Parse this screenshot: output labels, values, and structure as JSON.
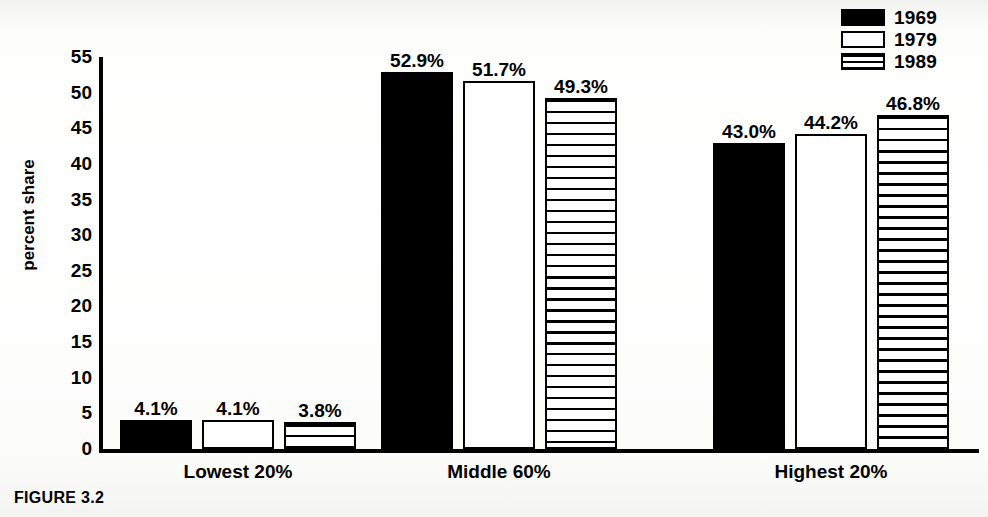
{
  "figure": {
    "caption": "FIGURE 3.2"
  },
  "legend": {
    "position": "top-right",
    "entries": [
      {
        "label": "1969",
        "pattern": "solid",
        "swatch_icon": "solid-black-swatch-icon"
      },
      {
        "label": "1979",
        "pattern": "empty",
        "swatch_icon": "empty-white-swatch-icon"
      },
      {
        "label": "1989",
        "pattern": "hatch",
        "swatch_icon": "horizontal-hatch-swatch-icon"
      }
    ]
  },
  "chart_data": {
    "type": "bar",
    "title": "",
    "xlabel": "",
    "ylabel": "percent share",
    "ylim": [
      0,
      55
    ],
    "yticks": [
      0,
      5,
      10,
      15,
      20,
      25,
      30,
      35,
      40,
      45,
      50,
      55
    ],
    "ytick_labels": [
      "0",
      "5",
      "10",
      "15",
      "20",
      "25",
      "30",
      "35",
      "40",
      "45",
      "50",
      "55"
    ],
    "grid": false,
    "legend_position": "upper right",
    "categories": [
      "Lowest 20%",
      "Middle 60%",
      "Highest 20%"
    ],
    "series": [
      {
        "name": "1969",
        "pattern": "solid",
        "values": [
          4.1,
          52.9,
          43.0
        ],
        "value_labels": [
          "4.1%",
          "52.9%",
          "43.0%"
        ]
      },
      {
        "name": "1979",
        "pattern": "empty",
        "values": [
          4.1,
          51.7,
          44.2
        ],
        "value_labels": [
          "4.1%",
          "51.7%",
          "44.2%"
        ]
      },
      {
        "name": "1989",
        "pattern": "hatch",
        "values": [
          3.8,
          49.3,
          46.8
        ],
        "value_labels": [
          "3.8%",
          "49.3%",
          "46.8%"
        ]
      }
    ]
  },
  "colors": {
    "ink": "#000000",
    "paper": "#ffffff"
  }
}
